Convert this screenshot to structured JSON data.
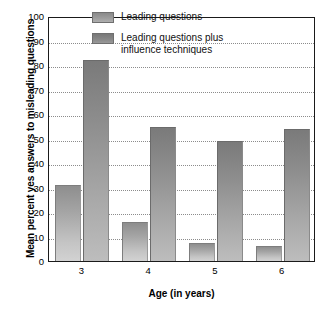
{
  "chart_data": {
    "type": "bar",
    "title": "",
    "subtitle": "",
    "xlabel": "Age (in years)",
    "ylabel": "Mean percent yes answers to misleading questions",
    "categories": [
      "3",
      "4",
      "5",
      "6"
    ],
    "series": [
      {
        "name": "Leading questions",
        "values": [
          31,
          16,
          7.5,
          6
        ],
        "color": "#a5a5a5"
      },
      {
        "name": "Leading questions plus\ninfluence techniques",
        "values": [
          82,
          54.5,
          49,
          54
        ],
        "color": "#8d8d8d"
      }
    ],
    "ylim": [
      0,
      100
    ],
    "y_ticks": [
      0,
      10,
      20,
      30,
      40,
      50,
      60,
      70,
      80,
      90,
      100
    ],
    "y_tick_labels": [
      "0",
      "10",
      "20",
      "30",
      "40",
      "50",
      "60",
      "70",
      "80",
      "90",
      "100"
    ],
    "grid": "horizontal-dotted",
    "legend_position": "inside-top-center"
  },
  "legend": {
    "entries": [
      {
        "label": "Leading questions"
      },
      {
        "label": "Leading questions plus\ninfluence techniques"
      }
    ]
  },
  "axes": {
    "x_title": "Age (in years)",
    "y_title": "Mean percent yes answers to misleading questions"
  }
}
